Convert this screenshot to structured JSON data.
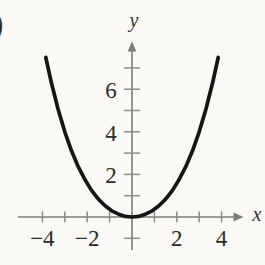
{
  "figure": {
    "label_paren": ")",
    "background_color": "#faf9f6"
  },
  "chart_data": {
    "type": "line",
    "title": "",
    "xlabel": "x",
    "ylabel": "y",
    "xlim": [
      -5.1,
      4.9
    ],
    "ylim": [
      -1.8,
      8.2
    ],
    "grid": false,
    "legend_position": "none",
    "x_ticks": [
      -4,
      -3,
      -2,
      -1,
      1,
      2,
      3,
      4
    ],
    "x_tick_labels": [
      {
        "value": -4,
        "label": "−4"
      },
      {
        "value": -2,
        "label": "−2"
      },
      {
        "value": 2,
        "label": "2"
      },
      {
        "value": 4,
        "label": "4"
      }
    ],
    "y_ticks": [
      1,
      2,
      3,
      4,
      5,
      6,
      7
    ],
    "y_tick_labels": [
      {
        "value": 2,
        "label": "2"
      },
      {
        "value": 4,
        "label": "4"
      },
      {
        "value": 6,
        "label": "6"
      }
    ],
    "y_axis_below_origin_tick": -1,
    "series": [
      {
        "name": "parabola",
        "description": "upward-opening parabola, vertex at the origin, passing through about (±2.2, 2) and ending near (±3.9, 7.5)",
        "points": [
          [
            -3.85,
            7.49
          ],
          [
            -3.6,
            6.3
          ],
          [
            -3.3,
            5.06
          ],
          [
            -3.0,
            4.0
          ],
          [
            -2.7,
            3.11
          ],
          [
            -2.4,
            2.36
          ],
          [
            -2.1,
            1.75
          ],
          [
            -1.8,
            1.24
          ],
          [
            -1.5,
            0.84
          ],
          [
            -1.2,
            0.53
          ],
          [
            -0.9,
            0.29
          ],
          [
            -0.6,
            0.13
          ],
          [
            -0.3,
            0.03
          ],
          [
            0,
            0
          ],
          [
            0.3,
            0.03
          ],
          [
            0.6,
            0.13
          ],
          [
            0.9,
            0.29
          ],
          [
            1.2,
            0.53
          ],
          [
            1.5,
            0.84
          ],
          [
            1.8,
            1.24
          ],
          [
            2.1,
            1.75
          ],
          [
            2.4,
            2.36
          ],
          [
            2.7,
            3.11
          ],
          [
            3.0,
            4.0
          ],
          [
            3.3,
            5.06
          ],
          [
            3.6,
            6.3
          ],
          [
            3.85,
            7.49
          ]
        ]
      }
    ],
    "colors": {
      "curve": "#161616",
      "axis": "#7c7c7c",
      "tick": "#8e8e8e",
      "tick_label": "#2b2b2b",
      "axis_letter": "#333333"
    }
  }
}
